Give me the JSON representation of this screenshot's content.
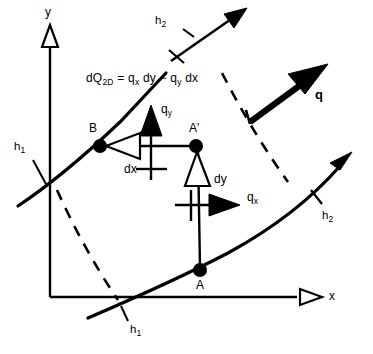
{
  "figure": {
    "background_color": "#ffffff",
    "stroke_color": "#000000"
  },
  "axes": {
    "x_label": "x",
    "y_label": "y",
    "x_arrow_icon": "hollow-triangle-arrowhead",
    "y_arrow_icon": "hollow-triangle-arrowhead",
    "origin": {
      "x": 50,
      "y": 297
    }
  },
  "equation": {
    "text": "dQ2D = qx dy − qy dx",
    "parts": {
      "lhs_main": "dQ",
      "lhs_sub": "2D",
      "eq_sign": "=",
      "term1_main": "q",
      "term1_sub": "x",
      "term1_diff": "dy",
      "minus": "−",
      "term2_main": "q",
      "term2_sub": "y",
      "term2_diff": "dx"
    }
  },
  "points": [
    {
      "name": "B",
      "label": "B",
      "cx": 100,
      "cy": 146,
      "r": 6.5
    },
    {
      "name": "A-prime",
      "label": "A'",
      "cx": 196,
      "cy": 146,
      "r": 6.5
    },
    {
      "name": "A",
      "label": "A",
      "cx": 200,
      "cy": 270,
      "r": 6.5
    }
  ],
  "flux_vectors": [
    {
      "name": "q-y",
      "main": "q",
      "sub": "y",
      "direction": "up",
      "head": "solid"
    },
    {
      "name": "q-x",
      "main": "q",
      "sub": "x",
      "direction": "right",
      "head": "solid"
    },
    {
      "name": "q-resultant",
      "main": "q",
      "sub": "",
      "direction": "up-right",
      "head": "solid-bold",
      "bold": true
    }
  ],
  "differentials": [
    {
      "name": "dx",
      "label": "dx",
      "direction": "left",
      "head": "hollow"
    },
    {
      "name": "dy",
      "label": "dy",
      "direction": "up",
      "head": "hollow"
    }
  ],
  "isotherms": [
    {
      "name": "h1-left",
      "main": "h",
      "sub": "1",
      "position": "left"
    },
    {
      "name": "h1-bottom",
      "main": "h",
      "sub": "1",
      "position": "bottom"
    },
    {
      "name": "h2-top",
      "main": "h",
      "sub": "2",
      "position": "top"
    },
    {
      "name": "h2-right",
      "main": "h",
      "sub": "2",
      "position": "right"
    }
  ]
}
